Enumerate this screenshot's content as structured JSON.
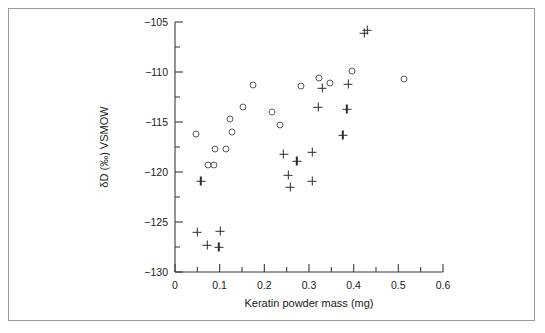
{
  "figure": {
    "background_color": "#ffffff",
    "frame_color": "#9a9a9a",
    "axis_color": "#3a3a3a"
  },
  "chart_data": {
    "type": "scatter",
    "title": "",
    "xlabel": "Keratin powder mass (mg)",
    "ylabel": "δD (‰) VSMOW",
    "xlim": [
      0,
      0.6
    ],
    "ylim": [
      -130,
      -105
    ],
    "xticks": [
      0,
      0.1,
      0.2,
      0.3,
      0.4,
      0.5,
      0.6
    ],
    "xtick_labels": [
      "0",
      "0.1",
      "0.2",
      "0.3",
      "0.4",
      "0.5",
      "0.6"
    ],
    "xminor_step": 0.05,
    "yticks": [
      -130,
      -125,
      -120,
      -115,
      -110,
      -105
    ],
    "ytick_labels": [
      "−130",
      "−125",
      "−120",
      "−115",
      "−110",
      "−105"
    ],
    "yminor_step": 2.5,
    "grid": false,
    "legend": "none",
    "series": [
      {
        "name": "open-circle-series",
        "marker": "open-circle",
        "color": "#5a5a5a",
        "points": [
          {
            "x": 0.048,
            "y": -116.2
          },
          {
            "x": 0.073,
            "y": -119.3
          },
          {
            "x": 0.088,
            "y": -119.3
          },
          {
            "x": 0.09,
            "y": -117.7
          },
          {
            "x": 0.114,
            "y": -117.7
          },
          {
            "x": 0.123,
            "y": -114.7
          },
          {
            "x": 0.127,
            "y": -116.0
          },
          {
            "x": 0.152,
            "y": -113.5
          },
          {
            "x": 0.175,
            "y": -111.3
          },
          {
            "x": 0.218,
            "y": -114.0
          },
          {
            "x": 0.236,
            "y": -115.3
          },
          {
            "x": 0.283,
            "y": -111.4
          },
          {
            "x": 0.322,
            "y": -110.6
          },
          {
            "x": 0.348,
            "y": -111.1
          },
          {
            "x": 0.396,
            "y": -109.9
          },
          {
            "x": 0.513,
            "y": -110.7
          }
        ]
      },
      {
        "name": "plus-series",
        "marker": "plus",
        "color": "#2b2b2b",
        "points": [
          {
            "x": 0.058,
            "y": -120.9
          },
          {
            "x": 0.05,
            "y": -126.0
          },
          {
            "x": 0.072,
            "y": -127.3
          },
          {
            "x": 0.101,
            "y": -125.9
          },
          {
            "x": 0.098,
            "y": -127.5
          },
          {
            "x": 0.243,
            "y": -118.2
          },
          {
            "x": 0.253,
            "y": -120.3
          },
          {
            "x": 0.258,
            "y": -121.5
          },
          {
            "x": 0.273,
            "y": -118.9
          },
          {
            "x": 0.307,
            "y": -118.0
          },
          {
            "x": 0.307,
            "y": -120.9
          },
          {
            "x": 0.321,
            "y": -113.5
          },
          {
            "x": 0.33,
            "y": -111.6
          },
          {
            "x": 0.376,
            "y": -116.3
          },
          {
            "x": 0.385,
            "y": -113.7
          },
          {
            "x": 0.388,
            "y": -111.2
          },
          {
            "x": 0.424,
            "y": -106.1
          },
          {
            "x": 0.43,
            "y": -105.8
          }
        ]
      }
    ]
  }
}
